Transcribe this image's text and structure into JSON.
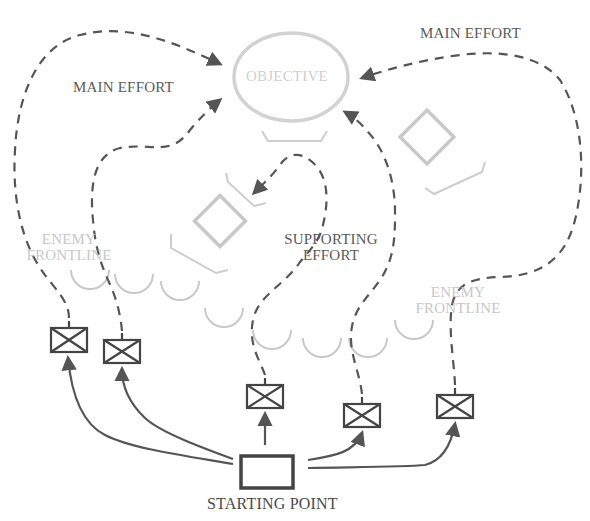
{
  "diagram": {
    "type": "tactical-maneuver-diagram",
    "objective": {
      "label": "OBJECTIVE"
    },
    "efforts": {
      "main_left": "MAIN EFFORT",
      "main_right": "MAIN EFFORT",
      "supporting_line1": "SUPPORTING",
      "supporting_line2": "EFFORT"
    },
    "enemy_frontline_left": {
      "line1": "ENEMY",
      "line2": "FRONTLINE"
    },
    "enemy_frontline_right": {
      "line1": "ENEMY",
      "line2": "FRONTLINE"
    },
    "start": {
      "label": "STARTING POINT"
    },
    "units": [
      {
        "id": "unit-1",
        "symbol": "infantry"
      },
      {
        "id": "unit-2",
        "symbol": "infantry"
      },
      {
        "id": "unit-3",
        "symbol": "infantry"
      },
      {
        "id": "unit-4",
        "symbol": "infantry"
      },
      {
        "id": "unit-5",
        "symbol": "infantry"
      }
    ],
    "enemy_positions": [
      {
        "id": "enemy-position-center",
        "symbol": "diamond"
      },
      {
        "id": "enemy-position-right",
        "symbol": "diamond"
      }
    ],
    "colors": {
      "path": "#555555",
      "friendly": "#444444",
      "enemy": "#c8c8c8",
      "objective": "#d0d0d0"
    }
  }
}
